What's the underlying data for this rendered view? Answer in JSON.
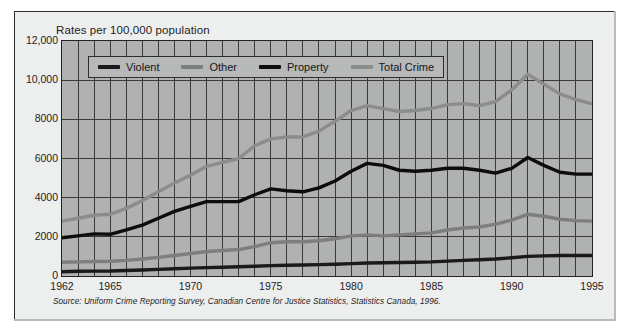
{
  "figure": {
    "title": "Rates per 100,000 population",
    "source_note": "Source: Uniform Crime Reporting Survey, Canadian Centre for Justice Statistics, Statistics Canada, 1996."
  },
  "colors": {
    "plot_background": "#b0b1b1",
    "panel_background": "#edeeee",
    "grid": "#3a3a3a",
    "axis_border": "#232323",
    "violent": "#1a1a1a",
    "other": "#7d7e7e",
    "property": "#0d0d0d",
    "total_crime": "#8b8c8c",
    "legend_background": "#b7b8b8"
  },
  "legend": {
    "position": "inside-top-left",
    "entries": [
      {
        "label": "Violent",
        "color": "#1a1a1a"
      },
      {
        "label": "Other",
        "color": "#7d7e7e"
      },
      {
        "label": "Property",
        "color": "#0d0d0d"
      },
      {
        "label": "Total Crime",
        "color": "#8b8c8c"
      }
    ]
  },
  "chart_data": {
    "type": "line",
    "title": "Rates per 100,000 population",
    "xlabel": "",
    "ylabel": "Rates per 100,000 population",
    "xlim": [
      1962,
      1995
    ],
    "ylim": [
      0,
      12000
    ],
    "grid": true,
    "legend_position": "inside-top-left",
    "x": [
      1962,
      1963,
      1964,
      1965,
      1966,
      1967,
      1968,
      1969,
      1970,
      1971,
      1972,
      1973,
      1974,
      1975,
      1976,
      1977,
      1978,
      1979,
      1980,
      1981,
      1982,
      1983,
      1984,
      1985,
      1986,
      1987,
      1988,
      1989,
      1990,
      1991,
      1992,
      1993,
      1994,
      1995
    ],
    "xticks": [
      1962,
      1965,
      1970,
      1975,
      1980,
      1985,
      1990,
      1995
    ],
    "xtick_labels": [
      "1962",
      "1965",
      "1970",
      "1975",
      "1980",
      "1985",
      "1990",
      "1995"
    ],
    "yticks": [
      0,
      2000,
      4000,
      6000,
      8000,
      10000,
      12000
    ],
    "ytick_labels": [
      "0",
      "2000",
      "4000",
      "6000",
      "8000",
      "10,000",
      "12,000"
    ],
    "series": [
      {
        "name": "Total Crime",
        "color": "#8b8c8c",
        "values": [
          2800,
          2950,
          3100,
          3150,
          3450,
          3850,
          4300,
          4750,
          5150,
          5600,
          5800,
          6000,
          6650,
          7000,
          7100,
          7100,
          7400,
          7900,
          8450,
          8700,
          8550,
          8400,
          8450,
          8550,
          8750,
          8800,
          8700,
          8900,
          9500,
          10300,
          9800,
          9300,
          9000,
          8800
        ]
      },
      {
        "name": "Property",
        "color": "#0d0d0d",
        "values": [
          1950,
          2050,
          2150,
          2130,
          2350,
          2600,
          2950,
          3300,
          3550,
          3800,
          3800,
          3800,
          4150,
          4450,
          4350,
          4300,
          4500,
          4850,
          5350,
          5750,
          5650,
          5400,
          5350,
          5400,
          5500,
          5500,
          5400,
          5250,
          5500,
          6050,
          5650,
          5300,
          5200,
          5200
        ]
      },
      {
        "name": "Other",
        "color": "#7d7e7e",
        "values": [
          700,
          720,
          740,
          750,
          800,
          870,
          950,
          1050,
          1150,
          1250,
          1300,
          1350,
          1500,
          1700,
          1750,
          1750,
          1800,
          1900,
          2050,
          2100,
          2050,
          2100,
          2150,
          2200,
          2350,
          2450,
          2500,
          2650,
          2850,
          3150,
          3050,
          2900,
          2830,
          2800
        ]
      },
      {
        "name": "Violent",
        "color": "#1a1a1a",
        "values": [
          220,
          240,
          250,
          255,
          280,
          310,
          340,
          370,
          400,
          430,
          450,
          470,
          500,
          530,
          550,
          560,
          580,
          600,
          630,
          660,
          680,
          690,
          700,
          720,
          760,
          800,
          830,
          870,
          930,
          1000,
          1030,
          1050,
          1050,
          1050
        ]
      }
    ]
  }
}
